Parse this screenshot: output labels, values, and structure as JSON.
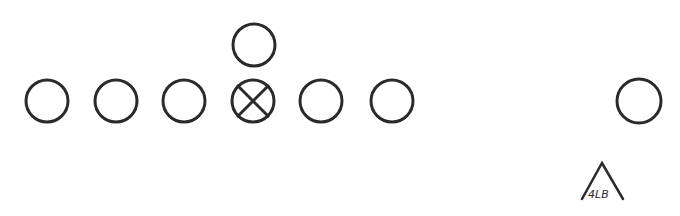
{
  "diagram": {
    "type": "football formation",
    "offense": {
      "line": [
        {
          "id": "player-1",
          "shape": "circle",
          "x": 47,
          "y": 101
        },
        {
          "id": "player-2",
          "shape": "circle",
          "x": 116,
          "y": 101
        },
        {
          "id": "player-3",
          "shape": "circle",
          "x": 184,
          "y": 101
        },
        {
          "id": "center",
          "shape": "circle-x",
          "x": 253,
          "y": 101
        },
        {
          "id": "player-5",
          "shape": "circle",
          "x": 321,
          "y": 101
        },
        {
          "id": "player-6",
          "shape": "circle",
          "x": 392,
          "y": 101
        }
      ],
      "backfield": [
        {
          "id": "back",
          "shape": "circle",
          "x": 254,
          "y": 45
        }
      ],
      "wide": [
        {
          "id": "wide-receiver",
          "shape": "circle",
          "x": 639,
          "y": 101
        }
      ]
    },
    "defense": [
      {
        "id": "linebacker",
        "shape": "triangle",
        "label": "4LB",
        "x": 602,
        "y": 185
      }
    ],
    "colors": {
      "stroke": "#2a2a2a",
      "background": "#ffffff"
    }
  }
}
